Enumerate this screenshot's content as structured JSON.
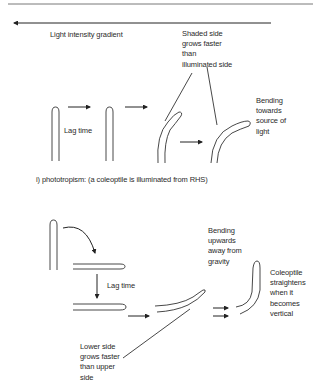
{
  "top_section": {
    "gradient_label": "Light intensity gradient",
    "shaded_note": [
      "Shaded side",
      "grows faster",
      "than",
      "illuminated side"
    ],
    "lag_time": "Lag time",
    "bending_note": [
      "Bending",
      "towards",
      "source of",
      "light"
    ],
    "caption": "i) phototropism: (a coleoptile is illuminated from RHS)"
  },
  "bottom_section": {
    "lag_time": "Lag time",
    "bending_note": [
      "Bending",
      "upwards",
      "away from",
      "gravity"
    ],
    "straightens_note": [
      "Coleoptile",
      "straightens",
      "when it",
      "becomes",
      "vertical"
    ],
    "lower_side_note": [
      "Lower side",
      "grows faster",
      "than upper",
      "side"
    ]
  },
  "colors": {
    "stroke": "#333333",
    "background": "#ffffff"
  }
}
